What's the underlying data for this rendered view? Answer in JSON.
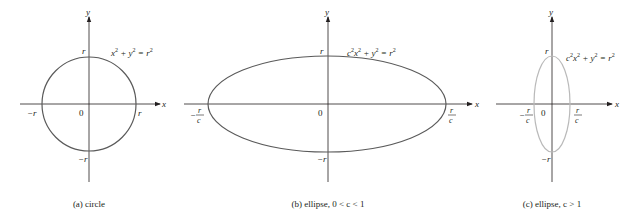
{
  "colors": {
    "axis": "#231f20",
    "curve_dark": "#5a5a5a",
    "curve_light": "#b9b9b9",
    "text": "#231f20"
  },
  "panels": [
    {
      "id": "a",
      "caption": "(a) circle",
      "equation": {
        "lhs1": "x",
        "sup1": "2",
        "plus": " + y",
        "sup2": "2",
        "eq": " = r",
        "sup3": "2"
      },
      "labels": {
        "x_axis": "x",
        "y_axis": "y",
        "origin": "0",
        "top": "r",
        "bottom": "−r",
        "left": "−r",
        "right": "r"
      }
    },
    {
      "id": "b",
      "caption": "(b) ellipse, 0 < c < 1",
      "equation": {
        "c": "c",
        "csup": "2",
        "x": "x",
        "xsup": "2",
        "plus": " + y",
        "ysup": "2",
        "eq": " = r",
        "rsup": "2"
      },
      "labels": {
        "x_axis": "x",
        "y_axis": "y",
        "origin": "0",
        "top": "r",
        "bottom": "−r",
        "left_num": "r",
        "left_den": "c",
        "left_sign": "−",
        "right_num": "r",
        "right_den": "c"
      }
    },
    {
      "id": "c",
      "caption": "(c) ellipse,  c > 1",
      "equation": {
        "c": "c",
        "csup": "2",
        "x": "x",
        "xsup": "2",
        "plus": " + y",
        "ysup": "2",
        "eq": " = r",
        "rsup": "2"
      },
      "labels": {
        "x_axis": "x",
        "y_axis": "y",
        "origin": "0",
        "top": "r",
        "bottom": "−r",
        "left_num": "r",
        "left_den": "c",
        "left_sign": "−",
        "right_num": "r",
        "right_den": "c"
      }
    }
  ]
}
